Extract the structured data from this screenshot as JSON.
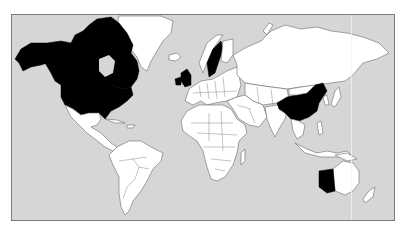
{
  "map": {
    "type": "world choropleth (Mercator)",
    "colors": {
      "ocean": "#d6d6d6",
      "land": "#ffffff",
      "highlighted": "#000000",
      "borders": "#6a6a6a"
    },
    "highlighted_regions": [
      "Canada",
      "United States (incl. Alaska)",
      "United Kingdom",
      "Sweden",
      "China",
      "Western Australia"
    ]
  }
}
